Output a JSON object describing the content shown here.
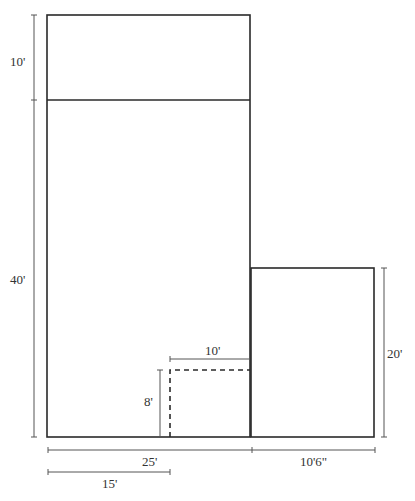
{
  "diagram": {
    "type": "floor-plan",
    "rooms": [
      {
        "name": "top-room",
        "width": "25'",
        "depth": "10'"
      },
      {
        "name": "main-room",
        "width": "25'",
        "depth": "40'"
      },
      {
        "name": "side-room",
        "width": "10'6\"",
        "depth": "20'"
      },
      {
        "name": "closet-area",
        "width": "10'",
        "depth": "8'"
      }
    ],
    "dimensions": {
      "top_height": "10'",
      "main_height": "40'",
      "side_height": "20'",
      "closet_width": "10'",
      "closet_height": "8'",
      "main_width": "25'",
      "side_width": "10'6\"",
      "offset_width": "15'"
    },
    "colors": {
      "line": "#2a2a2a",
      "dimension": "#555555"
    }
  }
}
